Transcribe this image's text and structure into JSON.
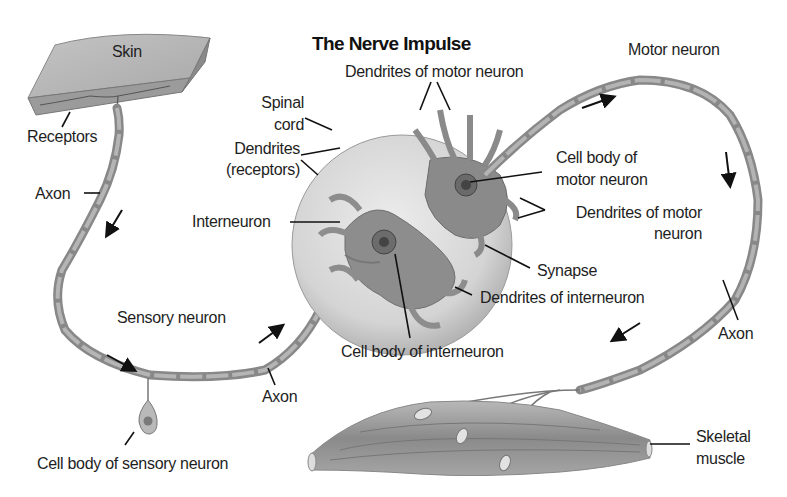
{
  "title": "The Nerve Impulse",
  "colors": {
    "background": "#ffffff",
    "tissue": "#8e8e8e",
    "tissue_light": "#c8c8c8",
    "spinal_cord": "#d6d6d6",
    "ink": "#1e1e1e"
  },
  "labels": {
    "skin": "Skin",
    "receptors": "Receptors",
    "axon_sensory_upper": "Axon",
    "spinal_cord_line1": "Spinal",
    "spinal_cord_line2": "cord",
    "dendrites_receptors_line1": "Dendrites",
    "dendrites_receptors_line2": "(receptors)",
    "interneuron": "Interneuron",
    "sensory_neuron": "Sensory neuron",
    "axon_sensory_lower": "Axon",
    "cell_body_sensory": "Cell body of sensory neuron",
    "dendrites_motor_top": "Dendrites of motor neuron",
    "motor_neuron": "Motor neuron",
    "cell_body_motor_line1": "Cell body of",
    "cell_body_motor_line2": "motor neuron",
    "dendrites_motor_right_line1": "Dendrites of motor",
    "dendrites_motor_right_line2": "neuron",
    "synapse": "Synapse",
    "dendrites_interneuron": "Dendrites of interneuron",
    "cell_body_interneuron": "Cell body of interneuron",
    "axon_motor": "Axon",
    "skeletal_muscle_line1": "Skeletal",
    "skeletal_muscle_line2": "muscle"
  },
  "icons": {
    "flow_arrows": [
      "arrow-down-left",
      "arrow-down-right",
      "arrow-up-right",
      "arrow-right",
      "arrow-down",
      "arrow-down-left"
    ]
  }
}
